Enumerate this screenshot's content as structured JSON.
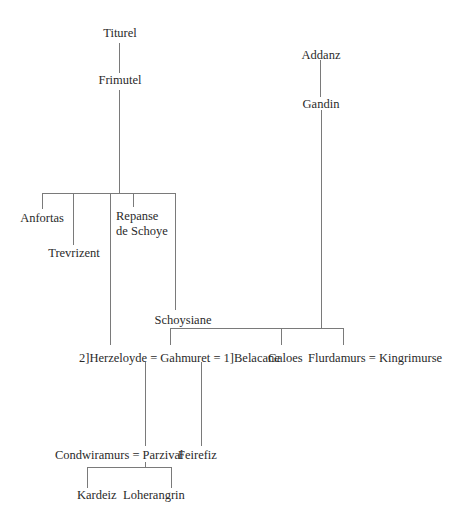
{
  "diagram": {
    "type": "genealogy-tree",
    "left_lineage": {
      "root": "Titurel",
      "child": "Frimutel",
      "children_of_frimutel": [
        "Anfortas",
        "Trevrizent",
        "Repanse de Schoye",
        "Schoysiane",
        "Herzeloyde"
      ]
    },
    "right_lineage": {
      "root": "Addanz",
      "child": "Gandin",
      "children_of_gandin": [
        "Gahmuret",
        "Galoes",
        "Flurdamurs"
      ]
    }
  },
  "labels": {
    "titurel": "Titurel",
    "frimutel": "Frimutel",
    "anfortas": "Anfortas",
    "trevrizent": "Trevrizent",
    "repanse_line1": "Repanse",
    "repanse_line2": "de Schoye",
    "schoysiane": "Schoysiane",
    "addanz": "Addanz",
    "gandin": "Gandin",
    "marriage_row": "2]Herzeloyde = Gahmuret = 1]Belacane",
    "galoes": "Galoes",
    "flurdamurs_row": "Flurdamurs = Kingrimurse",
    "parzival_row": "Condwiramurs = Parzival",
    "feirefiz": "Feirefiz",
    "kardeiz": "Kardeiz",
    "loherangrin": "Loherangrin"
  },
  "relationships": [
    {
      "parent": "Titurel",
      "child": "Frimutel"
    },
    {
      "parent": "Frimutel",
      "children": [
        "Anfortas",
        "Trevrizent",
        "Herzeloyde",
        "Repanse de Schoye",
        "Schoysiane"
      ]
    },
    {
      "parent": "Addanz",
      "child": "Gandin"
    },
    {
      "parent": "Gandin",
      "children": [
        "Gahmuret",
        "Galoes",
        "Flurdamurs"
      ]
    },
    {
      "marriage": [
        "Herzeloyde",
        "Gahmuret"
      ],
      "order": 2,
      "children": [
        "Parzival"
      ]
    },
    {
      "marriage": [
        "Gahmuret",
        "Belacane"
      ],
      "order": 1,
      "children": [
        "Feirefiz"
      ]
    },
    {
      "marriage": [
        "Flurdamurs",
        "Kingrimurse"
      ]
    },
    {
      "marriage": [
        "Condwiramurs",
        "Parzival"
      ],
      "children": [
        "Kardeiz",
        "Loherangrin"
      ]
    }
  ],
  "colors": {
    "line": "#7a7a7a",
    "text": "#2a2a2a",
    "background": "#ffffff"
  }
}
